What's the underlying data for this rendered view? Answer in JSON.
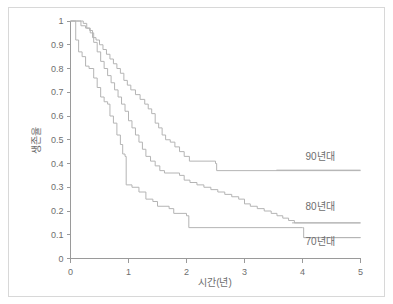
{
  "figure": {
    "border_color": "#d8d8d8",
    "background": "#ffffff",
    "axis_color": "#9a9a9a",
    "curve_color": "#b4b4b4",
    "text_color": "#6e6e6e"
  },
  "chart_data": {
    "type": "line",
    "subtype": "kaplan-meier-step",
    "title": "",
    "xlabel": "시간(년)",
    "ylabel": "생존율",
    "xlim": [
      0,
      5
    ],
    "ylim": [
      0,
      1
    ],
    "grid": false,
    "legend_position": "inline-right",
    "xticks": [
      "0",
      "1",
      "2",
      "3",
      "4",
      "5"
    ],
    "xtick_values": [
      0,
      1,
      2,
      3,
      4,
      5
    ],
    "yticks": [
      "0",
      "0.1",
      "0.2",
      "0.3",
      "0.4",
      "0.5",
      "0.6",
      "0.7",
      "0.8",
      "0.9",
      "1"
    ],
    "ytick_values": [
      0,
      0.1,
      0.2,
      0.3,
      0.4,
      0.5,
      0.6,
      0.7,
      0.8,
      0.9,
      1
    ],
    "series": [
      {
        "name": "90년대",
        "label": "90년대",
        "label_x": 4.05,
        "label_y": 0.415,
        "underline_from_x": 3.55,
        "underline_to_x": 5.0,
        "underline_y": 0.372,
        "color": "#b4b4b4",
        "points": [
          [
            0.0,
            1.0
          ],
          [
            0.1,
            1.0
          ],
          [
            0.18,
            0.98
          ],
          [
            0.26,
            0.97
          ],
          [
            0.33,
            0.96
          ],
          [
            0.38,
            0.93
          ],
          [
            0.44,
            0.92
          ],
          [
            0.5,
            0.9
          ],
          [
            0.56,
            0.88
          ],
          [
            0.62,
            0.86
          ],
          [
            0.68,
            0.84
          ],
          [
            0.74,
            0.82
          ],
          [
            0.8,
            0.8
          ],
          [
            0.86,
            0.78
          ],
          [
            0.92,
            0.75
          ],
          [
            0.98,
            0.73
          ],
          [
            1.04,
            0.71
          ],
          [
            1.12,
            0.69
          ],
          [
            1.2,
            0.67
          ],
          [
            1.28,
            0.65
          ],
          [
            1.34,
            0.63
          ],
          [
            1.4,
            0.61
          ],
          [
            1.46,
            0.57
          ],
          [
            1.52,
            0.55
          ],
          [
            1.58,
            0.52
          ],
          [
            1.64,
            0.5
          ],
          [
            1.72,
            0.49
          ],
          [
            1.8,
            0.47
          ],
          [
            1.88,
            0.45
          ],
          [
            1.96,
            0.43
          ],
          [
            2.05,
            0.41
          ],
          [
            2.5,
            0.4
          ],
          [
            2.52,
            0.37
          ],
          [
            5.0,
            0.37
          ]
        ]
      },
      {
        "name": "80년대",
        "label": "80년대",
        "label_x": 4.05,
        "label_y": 0.205,
        "underline_from_x": 3.82,
        "underline_to_x": 5.0,
        "underline_y": 0.15,
        "color": "#b4b4b4",
        "points": [
          [
            0.0,
            1.0
          ],
          [
            0.16,
            1.0
          ],
          [
            0.22,
            0.99
          ],
          [
            0.28,
            0.97
          ],
          [
            0.34,
            0.95
          ],
          [
            0.4,
            0.91
          ],
          [
            0.46,
            0.87
          ],
          [
            0.52,
            0.83
          ],
          [
            0.58,
            0.8
          ],
          [
            0.64,
            0.77
          ],
          [
            0.7,
            0.74
          ],
          [
            0.76,
            0.71
          ],
          [
            0.82,
            0.68
          ],
          [
            0.88,
            0.65
          ],
          [
            0.94,
            0.62
          ],
          [
            1.0,
            0.58
          ],
          [
            1.06,
            0.55
          ],
          [
            1.12,
            0.52
          ],
          [
            1.18,
            0.49
          ],
          [
            1.24,
            0.46
          ],
          [
            1.3,
            0.43
          ],
          [
            1.38,
            0.41
          ],
          [
            1.46,
            0.39
          ],
          [
            1.54,
            0.37
          ],
          [
            1.62,
            0.36
          ],
          [
            1.88,
            0.35
          ],
          [
            1.96,
            0.33
          ],
          [
            2.06,
            0.32
          ],
          [
            2.18,
            0.31
          ],
          [
            2.3,
            0.3
          ],
          [
            2.42,
            0.29
          ],
          [
            2.54,
            0.28
          ],
          [
            2.66,
            0.27
          ],
          [
            2.78,
            0.26
          ],
          [
            2.9,
            0.25
          ],
          [
            3.0,
            0.23
          ],
          [
            3.1,
            0.22
          ],
          [
            3.22,
            0.21
          ],
          [
            3.34,
            0.2
          ],
          [
            3.46,
            0.19
          ],
          [
            3.56,
            0.18
          ],
          [
            3.66,
            0.17
          ],
          [
            3.76,
            0.16
          ],
          [
            3.86,
            0.15
          ],
          [
            5.0,
            0.15
          ]
        ]
      },
      {
        "name": "70년대",
        "label": "70년대",
        "label_x": 4.05,
        "label_y": 0.055,
        "underline_from_x": 4.02,
        "underline_to_x": 5.0,
        "underline_y": 0.088,
        "color": "#b4b4b4",
        "points": [
          [
            0.0,
            1.0
          ],
          [
            0.06,
            1.0
          ],
          [
            0.09,
            0.92
          ],
          [
            0.14,
            0.87
          ],
          [
            0.2,
            0.85
          ],
          [
            0.26,
            0.81
          ],
          [
            0.32,
            0.8
          ],
          [
            0.4,
            0.76
          ],
          [
            0.46,
            0.72
          ],
          [
            0.52,
            0.68
          ],
          [
            0.58,
            0.66
          ],
          [
            0.64,
            0.65
          ],
          [
            0.68,
            0.6
          ],
          [
            0.74,
            0.57
          ],
          [
            0.8,
            0.52
          ],
          [
            0.86,
            0.48
          ],
          [
            0.9,
            0.44
          ],
          [
            0.94,
            0.43
          ],
          [
            0.96,
            0.31
          ],
          [
            1.06,
            0.3
          ],
          [
            1.18,
            0.28
          ],
          [
            1.3,
            0.25
          ],
          [
            1.42,
            0.24
          ],
          [
            1.5,
            0.22
          ],
          [
            1.7,
            0.21
          ],
          [
            1.78,
            0.19
          ],
          [
            2.0,
            0.18
          ],
          [
            2.04,
            0.13
          ],
          [
            4.0,
            0.13
          ],
          [
            4.02,
            0.088
          ],
          [
            5.0,
            0.088
          ]
        ]
      }
    ]
  }
}
